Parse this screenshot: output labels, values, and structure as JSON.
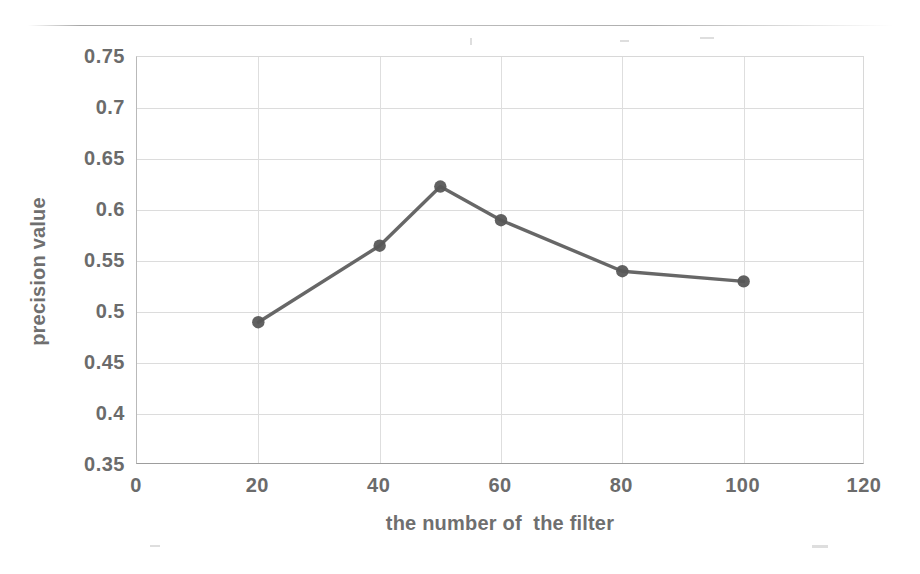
{
  "chart_data": {
    "type": "line",
    "title": "",
    "subtitle": "",
    "xlabel": "the number of  the filter",
    "ylabel": "precision value",
    "x": [
      20,
      40,
      50,
      60,
      80,
      100
    ],
    "values": [
      0.49,
      0.565,
      0.623,
      0.59,
      0.54,
      0.53
    ],
    "series": [
      {
        "name": "precision",
        "x": [
          20,
          40,
          50,
          60,
          80,
          100
        ],
        "values": [
          0.49,
          0.565,
          0.623,
          0.59,
          0.54,
          0.53
        ]
      }
    ],
    "xlim": [
      0,
      120
    ],
    "ylim": [
      0.35,
      0.75
    ],
    "xticks": [
      "0",
      "20",
      "40",
      "60",
      "80",
      "100",
      "120"
    ],
    "xtick_values": [
      0,
      20,
      40,
      60,
      80,
      100,
      120
    ],
    "yticks": [
      "0.35",
      "0.4",
      "0.45",
      "0.5",
      "0.55",
      "0.6",
      "0.65",
      "0.7",
      "0.75"
    ],
    "ytick_values": [
      0.35,
      0.4,
      0.45,
      0.5,
      0.55,
      0.6,
      0.65,
      0.7,
      0.75
    ],
    "grid": true,
    "legend": false,
    "legend_position": "none",
    "annotations": [],
    "marker": "circle",
    "colors": {
      "line": "#5a5a5a",
      "marker": "#575757",
      "grid": "#dcdcdc",
      "axis": "#a8a8a8",
      "tick_text": "#6b6b6b",
      "label_text": "#6f6f6f",
      "background": "#ffffff"
    }
  }
}
